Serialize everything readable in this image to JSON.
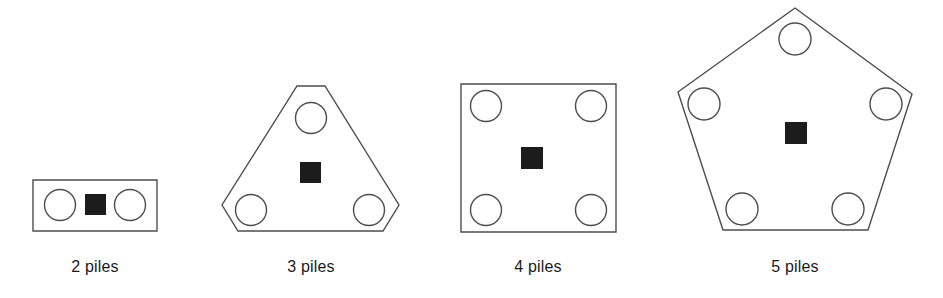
{
  "figure": {
    "background_color": "#ffffff",
    "outline_color": "#4d4d4d",
    "marker_color": "#1c1c1c",
    "caption_color": "#1a1a1a",
    "width": 943,
    "height": 298
  },
  "chart_data": {
    "type": "diagram",
    "groups": [
      {
        "id": "group-2-piles",
        "caption": "2 piles",
        "pile_count": 2,
        "shape": "rectangle",
        "shape_points": "33,180 157,180 157,231 33,231",
        "caption_x": 95,
        "caption_y": 272,
        "circles": [
          {
            "cx": 60,
            "cy": 205,
            "r": 15.5
          },
          {
            "cx": 130,
            "cy": 205,
            "r": 15.5
          }
        ],
        "marker": {
          "x": 85,
          "y": 194,
          "w": 21,
          "h": 21
        }
      },
      {
        "id": "group-3-piles",
        "caption": "3 piles",
        "pile_count": 3,
        "shape": "chamfered-triangle",
        "shape_points": "297,86 325,86 399,205 383,231 238,231 222,205",
        "caption_x": 311,
        "caption_y": 272,
        "circles": [
          {
            "cx": 311,
            "cy": 118,
            "r": 15.5
          },
          {
            "cx": 251,
            "cy": 210,
            "r": 15.5
          },
          {
            "cx": 369,
            "cy": 210,
            "r": 15.5
          }
        ],
        "marker": {
          "x": 300,
          "y": 162,
          "w": 21,
          "h": 21
        }
      },
      {
        "id": "group-4-piles",
        "caption": "4 piles",
        "pile_count": 4,
        "shape": "square",
        "shape_points": "461,84 616,84 616,232 461,232",
        "caption_x": 538,
        "caption_y": 272,
        "circles": [
          {
            "cx": 486,
            "cy": 106,
            "r": 15.5
          },
          {
            "cx": 591,
            "cy": 106,
            "r": 15.5
          },
          {
            "cx": 486,
            "cy": 210,
            "r": 15.5
          },
          {
            "cx": 591,
            "cy": 210,
            "r": 15.5
          }
        ],
        "marker": {
          "x": 521,
          "y": 147,
          "w": 22,
          "h": 22
        }
      },
      {
        "id": "group-5-piles",
        "caption": "5 piles",
        "pile_count": 5,
        "shape": "pentagon",
        "shape_points": "795,8 912,94 868,230 723,230 678,92",
        "caption_x": 795,
        "caption_y": 272,
        "circles": [
          {
            "cx": 795,
            "cy": 39,
            "r": 16
          },
          {
            "cx": 704,
            "cy": 104,
            "r": 16
          },
          {
            "cx": 886,
            "cy": 104,
            "r": 16
          },
          {
            "cx": 742,
            "cy": 209,
            "r": 16
          },
          {
            "cx": 848,
            "cy": 209,
            "r": 16
          }
        ],
        "marker": {
          "x": 785,
          "y": 122,
          "w": 22,
          "h": 22
        }
      }
    ]
  }
}
